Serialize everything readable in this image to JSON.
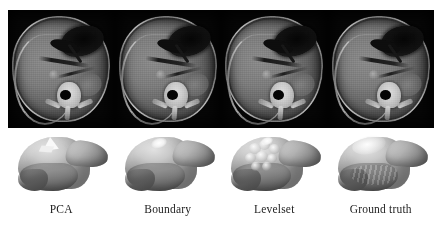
{
  "figure": {
    "name": "liver-segmentation-comparison-figure",
    "background_color": "#ffffff",
    "rows": {
      "ct_row_label": "Axial abdominal CT slices",
      "mesh_row_label": "3D liver surface renderings"
    }
  },
  "panels": [
    {
      "caption": "PCA",
      "ct": {
        "modality": "CT",
        "view": "axial abdomen",
        "background_color": "#050505",
        "tissue_color": "#757575",
        "bone_color": "#cfcfcf",
        "gas_color": "#101010"
      },
      "mesh": {
        "style": "faceted",
        "surface_color": "#bdbdbd",
        "highlight_color": "#fbfbfb",
        "shadow_color": "#555555"
      }
    },
    {
      "caption": "Boundary",
      "ct": {
        "modality": "CT",
        "view": "axial abdomen",
        "background_color": "#050505",
        "tissue_color": "#757575",
        "bone_color": "#cfcfcf",
        "gas_color": "#101010"
      },
      "mesh": {
        "style": "smooth-dome",
        "surface_color": "#c2c2c2",
        "highlight_color": "#ffffff",
        "shadow_color": "#585858"
      }
    },
    {
      "caption": "Levelset",
      "ct": {
        "modality": "CT",
        "view": "axial abdomen",
        "background_color": "#050505",
        "tissue_color": "#757575",
        "bone_color": "#cfcfcf",
        "gas_color": "#101010"
      },
      "mesh": {
        "style": "lumpy",
        "surface_color": "#bcbcbc",
        "highlight_color": "#f4f4f4",
        "shadow_color": "#4f4f4f"
      }
    },
    {
      "caption": "Ground truth",
      "ct": {
        "modality": "CT",
        "view": "axial abdomen",
        "background_color": "#050505",
        "tissue_color": "#757575",
        "bone_color": "#cfcfcf",
        "gas_color": "#101010"
      },
      "mesh": {
        "style": "smooth-ridged",
        "surface_color": "#c8c8c8",
        "highlight_color": "#ffffff",
        "shadow_color": "#555555"
      }
    }
  ]
}
